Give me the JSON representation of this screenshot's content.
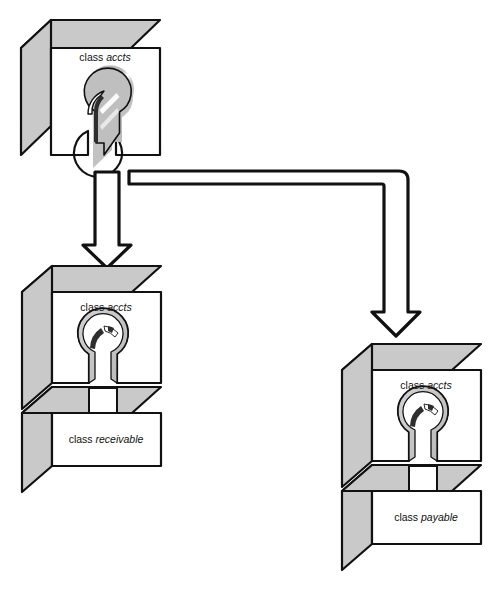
{
  "diagram": {
    "background_color": "#ffffff",
    "stroke_color": "#111111",
    "face_front_color": "#ffffff",
    "face_top_color": "#c9c9c9",
    "face_side_color": "#c9c9c9",
    "keyhole_fill_color": "#c9c9c9",
    "highlight_color": "#ffffff",
    "shadow_color": "#2b2b2b",
    "blocks": [
      {
        "id": "base-block",
        "name": "base-accts-block",
        "kind": "solid-plug",
        "labels": [
          {
            "prefix": "class",
            "name": "accts"
          }
        ]
      },
      {
        "id": "receivable-block",
        "name": "receivable-assembly",
        "kind": "socket-and-tab",
        "labels": [
          {
            "prefix": "class",
            "name": "accts"
          },
          {
            "prefix": "class",
            "name": "receivable"
          }
        ]
      },
      {
        "id": "payable-block",
        "name": "payable-assembly",
        "kind": "socket-and-tab",
        "labels": [
          {
            "prefix": "class",
            "name": "accts"
          },
          {
            "prefix": "class",
            "name": "payable"
          }
        ]
      }
    ],
    "arrows": [
      {
        "id": "arrow-down-left",
        "name": "arrow-to-receivable",
        "shape": "straight-down",
        "direction": "down"
      },
      {
        "id": "arrow-elbow-right",
        "name": "arrow-to-payable",
        "shape": "elbow-right-then-down",
        "direction": "down"
      }
    ],
    "text": {
      "class_keyword": "class",
      "accts": "accts",
      "receivable": "receivable",
      "payable": "payable"
    }
  }
}
